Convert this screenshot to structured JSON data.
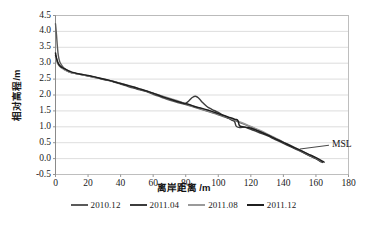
{
  "chart_data": {
    "type": "line",
    "title": "",
    "xlabel": "离岸距离 /m",
    "ylabel": "相对高程/m",
    "xlim": [
      0,
      180
    ],
    "ylim": [
      -0.5,
      4.5
    ],
    "xticks": [
      0,
      20,
      40,
      60,
      80,
      100,
      120,
      140,
      160,
      180
    ],
    "yticks": [
      -0.5,
      0.0,
      0.5,
      1.0,
      1.5,
      2.0,
      2.5,
      3.0,
      3.5,
      4.0,
      4.5
    ],
    "ytick_labels": [
      "-0.5",
      "0.0",
      "0.5",
      "1.0",
      "1.5",
      "2.0",
      "2.5",
      "3.0",
      "3.5",
      "4.0",
      "4.5"
    ],
    "xtick_labels": [
      "0",
      "20",
      "40",
      "60",
      "80",
      "100",
      "120",
      "140",
      "160",
      "180"
    ],
    "grid": "horizontal",
    "legend_position": "bottom",
    "annotations": [
      {
        "text": "MSL",
        "x": 168,
        "y": 0.42,
        "leader_from_x": 150,
        "leader_from_y": 0.3
      }
    ],
    "series": [
      {
        "name": "2010.12",
        "color": "#5a5a5a",
        "width": 1.4,
        "points": [
          [
            0,
            4.24
          ],
          [
            0.6,
            3.9
          ],
          [
            1.2,
            3.5
          ],
          [
            1.8,
            3.22
          ],
          [
            2.6,
            3.05
          ],
          [
            3.6,
            2.95
          ],
          [
            5,
            2.86
          ],
          [
            7,
            2.78
          ],
          [
            9,
            2.72
          ],
          [
            12,
            2.68
          ],
          [
            15,
            2.65
          ],
          [
            18,
            2.62
          ],
          [
            22,
            2.58
          ],
          [
            26,
            2.53
          ],
          [
            30,
            2.48
          ],
          [
            35,
            2.42
          ],
          [
            40,
            2.34
          ],
          [
            45,
            2.26
          ],
          [
            50,
            2.19
          ],
          [
            55,
            2.12
          ],
          [
            60,
            2.02
          ],
          [
            65,
            1.93
          ],
          [
            70,
            1.84
          ],
          [
            75,
            1.76
          ],
          [
            80,
            1.7
          ],
          [
            85,
            1.62
          ],
          [
            90,
            1.54
          ],
          [
            95,
            1.46
          ],
          [
            100,
            1.38
          ],
          [
            105,
            1.29
          ],
          [
            110,
            1.2
          ],
          [
            115,
            1.1
          ],
          [
            120,
            1.0
          ],
          [
            125,
            0.88
          ],
          [
            130,
            0.76
          ],
          [
            135,
            0.64
          ],
          [
            140,
            0.5
          ],
          [
            145,
            0.38
          ],
          [
            150,
            0.26
          ],
          [
            155,
            0.12
          ],
          [
            160,
            0.0
          ],
          [
            163,
            -0.1
          ]
        ]
      },
      {
        "name": "2011.04",
        "color": "#3c3c3c",
        "width": 1.4,
        "points": [
          [
            0,
            3.25
          ],
          [
            1,
            3.08
          ],
          [
            2,
            2.96
          ],
          [
            3.5,
            2.88
          ],
          [
            5,
            2.82
          ],
          [
            7,
            2.76
          ],
          [
            10,
            2.7
          ],
          [
            13,
            2.67
          ],
          [
            16,
            2.64
          ],
          [
            20,
            2.6
          ],
          [
            25,
            2.55
          ],
          [
            30,
            2.49
          ],
          [
            35,
            2.43
          ],
          [
            40,
            2.36
          ],
          [
            45,
            2.28
          ],
          [
            50,
            2.2
          ],
          [
            55,
            2.13
          ],
          [
            60,
            2.05
          ],
          [
            65,
            1.96
          ],
          [
            70,
            1.88
          ],
          [
            75,
            1.8
          ],
          [
            78,
            1.76
          ],
          [
            80,
            1.74
          ],
          [
            82,
            1.82
          ],
          [
            84,
            1.92
          ],
          [
            86,
            1.96
          ],
          [
            88,
            1.9
          ],
          [
            90,
            1.78
          ],
          [
            93,
            1.64
          ],
          [
            96,
            1.55
          ],
          [
            100,
            1.45
          ],
          [
            104,
            1.33
          ],
          [
            108,
            1.22
          ],
          [
            110,
            1.16
          ],
          [
            111,
            1.02
          ],
          [
            113,
            0.98
          ],
          [
            116,
            0.99
          ],
          [
            118,
            0.96
          ],
          [
            121,
            0.9
          ],
          [
            125,
            0.82
          ],
          [
            130,
            0.72
          ],
          [
            135,
            0.6
          ],
          [
            140,
            0.48
          ],
          [
            145,
            0.36
          ],
          [
            150,
            0.24
          ],
          [
            155,
            0.12
          ],
          [
            160,
            0.0
          ],
          [
            164,
            -0.12
          ]
        ]
      },
      {
        "name": "2011.08",
        "color": "#9a9a9a",
        "width": 1.4,
        "points": [
          [
            0,
            3.18
          ],
          [
            1,
            3.02
          ],
          [
            2.2,
            2.92
          ],
          [
            4,
            2.84
          ],
          [
            6,
            2.78
          ],
          [
            8,
            2.73
          ],
          [
            11,
            2.69
          ],
          [
            14,
            2.66
          ],
          [
            17,
            2.63
          ],
          [
            21,
            2.59
          ],
          [
            25,
            2.54
          ],
          [
            30,
            2.5
          ],
          [
            35,
            2.44
          ],
          [
            40,
            2.37
          ],
          [
            45,
            2.3
          ],
          [
            50,
            2.22
          ],
          [
            55,
            2.14
          ],
          [
            60,
            2.06
          ],
          [
            65,
            1.98
          ],
          [
            70,
            1.9
          ],
          [
            75,
            1.82
          ],
          [
            80,
            1.72
          ],
          [
            85,
            1.64
          ],
          [
            90,
            1.56
          ],
          [
            95,
            1.48
          ],
          [
            100,
            1.4
          ],
          [
            105,
            1.31
          ],
          [
            110,
            1.22
          ],
          [
            115,
            1.12
          ],
          [
            120,
            1.01
          ],
          [
            125,
            0.9
          ],
          [
            130,
            0.78
          ],
          [
            135,
            0.65
          ],
          [
            140,
            0.52
          ],
          [
            145,
            0.4
          ],
          [
            150,
            0.27
          ],
          [
            155,
            0.14
          ],
          [
            160,
            0.02
          ],
          [
            163,
            -0.07
          ]
        ]
      },
      {
        "name": "2011.12",
        "color": "#1f1f1f",
        "width": 1.5,
        "points": [
          [
            0,
            3.32
          ],
          [
            0.8,
            3.12
          ],
          [
            1.8,
            2.98
          ],
          [
            3,
            2.9
          ],
          [
            5,
            2.84
          ],
          [
            7.5,
            2.77
          ],
          [
            10,
            2.72
          ],
          [
            13,
            2.68
          ],
          [
            16,
            2.65
          ],
          [
            20,
            2.61
          ],
          [
            24,
            2.57
          ],
          [
            28,
            2.52
          ],
          [
            33,
            2.46
          ],
          [
            38,
            2.39
          ],
          [
            43,
            2.32
          ],
          [
            48,
            2.25
          ],
          [
            53,
            2.17
          ],
          [
            58,
            2.09
          ],
          [
            63,
            2.0
          ],
          [
            68,
            1.91
          ],
          [
            73,
            1.83
          ],
          [
            78,
            1.75
          ],
          [
            82,
            1.7
          ],
          [
            86,
            1.63
          ],
          [
            90,
            1.58
          ],
          [
            94,
            1.52
          ],
          [
            98,
            1.45
          ],
          [
            102,
            1.38
          ],
          [
            106,
            1.31
          ],
          [
            110,
            1.24
          ],
          [
            112,
            1.2
          ],
          [
            113,
            1.04
          ],
          [
            115,
            1.0
          ],
          [
            118,
            0.98
          ],
          [
            121,
            0.94
          ],
          [
            125,
            0.86
          ],
          [
            130,
            0.75
          ],
          [
            135,
            0.63
          ],
          [
            140,
            0.51
          ],
          [
            145,
            0.39
          ],
          [
            150,
            0.27
          ],
          [
            155,
            0.15
          ],
          [
            160,
            0.03
          ],
          [
            165,
            -0.11
          ]
        ]
      }
    ]
  },
  "legend": {
    "items": [
      {
        "label": "2010.12",
        "color": "#5a5a5a"
      },
      {
        "label": "2011.04",
        "color": "#3c3c3c"
      },
      {
        "label": "2011.08",
        "color": "#9a9a9a"
      },
      {
        "label": "2011.12",
        "color": "#1f1f1f"
      }
    ]
  },
  "annotation": {
    "msl": "MSL"
  },
  "colors": {
    "frame": "#b8b8b8",
    "grid": "#d4d4d4",
    "text": "#1a1a1a",
    "background": "#ffffff"
  }
}
